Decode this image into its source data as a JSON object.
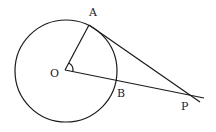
{
  "diagram": {
    "type": "geometry",
    "stroke_color": "#1a1a1a",
    "background": "#ffffff",
    "circle": {
      "center": "O",
      "cx": 66,
      "cy": 71,
      "r": 51
    },
    "points": {
      "O": {
        "label": "O",
        "x": 65,
        "y": 70,
        "label_x": 50,
        "label_y": 77
      },
      "A": {
        "label": "A",
        "x": 89,
        "y": 25,
        "label_x": 89,
        "label_y": 16
      },
      "B": {
        "label": "B",
        "x": 116,
        "y": 80,
        "label_x": 117,
        "label_y": 97
      },
      "P": {
        "label": "P",
        "x": 192,
        "y": 95,
        "label_x": 181,
        "label_y": 110
      }
    },
    "segments": [
      {
        "name": "radius-OA",
        "from": "O",
        "to": "A"
      },
      {
        "name": "line-OP",
        "from": "O",
        "to": "P",
        "extends_past": "P"
      },
      {
        "name": "tangent-AP",
        "from": "A",
        "to": "P",
        "extends_past": "P"
      }
    ],
    "angle_mark": {
      "at": "O",
      "between": [
        "A",
        "B"
      ]
    }
  }
}
